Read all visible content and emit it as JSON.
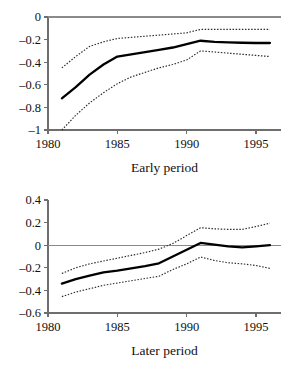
{
  "figure": {
    "background": "#ffffff",
    "line_color": "#000000",
    "band_color": "#2b2b2b",
    "axis_color": "#6e6e6e"
  },
  "chart_data": [
    {
      "id": "early",
      "type": "line",
      "title": "",
      "xlabel": "Early period",
      "ylabel": "",
      "xlim": [
        1980,
        1996.8
      ],
      "ylim": [
        -1,
        0
      ],
      "grid": false,
      "legend": "none",
      "xticks": [
        1980,
        1985,
        1990,
        1995
      ],
      "xticklabels": [
        "1980",
        "1985",
        "1990",
        "1995"
      ],
      "yticks": [
        0,
        -0.2,
        -0.4,
        -0.6,
        -0.8,
        -1
      ],
      "yticklabels": [
        "0",
        "–0.2",
        "–0.4",
        "–0.6",
        "–0.8",
        "–1"
      ],
      "x": [
        1981,
        1982,
        1983,
        1984,
        1985,
        1986,
        1987,
        1988,
        1989,
        1990,
        1991,
        1992,
        1993,
        1994,
        1995,
        1996
      ],
      "series": [
        {
          "name": "estimate",
          "style": "solid",
          "values": [
            -0.72,
            -0.62,
            -0.51,
            -0.42,
            -0.35,
            -0.33,
            -0.31,
            -0.29,
            -0.27,
            -0.24,
            -0.21,
            -0.22,
            -0.225,
            -0.228,
            -0.23,
            -0.23
          ]
        },
        {
          "name": "upper-confidence-band",
          "style": "dotted",
          "values": [
            -0.45,
            -0.35,
            -0.26,
            -0.22,
            -0.19,
            -0.18,
            -0.17,
            -0.16,
            -0.15,
            -0.14,
            -0.11,
            -0.11,
            -0.11,
            -0.11,
            -0.11,
            -0.11
          ]
        },
        {
          "name": "lower-confidence-band",
          "style": "dotted",
          "values": [
            -1.0,
            -0.87,
            -0.76,
            -0.67,
            -0.59,
            -0.53,
            -0.49,
            -0.45,
            -0.42,
            -0.38,
            -0.3,
            -0.31,
            -0.32,
            -0.33,
            -0.34,
            -0.35
          ]
        }
      ]
    },
    {
      "id": "later",
      "type": "line",
      "title": "",
      "xlabel": "Later period",
      "ylabel": "",
      "xlim": [
        1980,
        1996.8
      ],
      "ylim": [
        -0.6,
        0.4
      ],
      "grid": false,
      "legend": "none",
      "xticks": [
        1980,
        1985,
        1990,
        1995
      ],
      "xticklabels": [
        "1980",
        "1985",
        "1990",
        "1995"
      ],
      "yticks": [
        0.4,
        0.2,
        0,
        -0.2,
        -0.4,
        -0.6
      ],
      "yticklabels": [
        "0.4",
        "0.2",
        "0",
        "–0.2",
        "–0.4",
        "–0.6"
      ],
      "x": [
        1981,
        1982,
        1983,
        1984,
        1985,
        1986,
        1987,
        1988,
        1989,
        1990,
        1991,
        1992,
        1993,
        1994,
        1995,
        1996
      ],
      "series": [
        {
          "name": "estimate",
          "style": "solid",
          "values": [
            -0.34,
            -0.3,
            -0.27,
            -0.24,
            -0.225,
            -0.205,
            -0.185,
            -0.16,
            -0.1,
            -0.04,
            0.02,
            0.005,
            -0.01,
            -0.02,
            -0.01,
            0.0
          ]
        },
        {
          "name": "upper-confidence-band",
          "style": "dotted",
          "values": [
            -0.25,
            -0.2,
            -0.165,
            -0.14,
            -0.115,
            -0.09,
            -0.065,
            -0.035,
            0.015,
            0.085,
            0.155,
            0.145,
            0.14,
            0.14,
            0.165,
            0.195
          ]
        },
        {
          "name": "lower-confidence-band",
          "style": "dotted",
          "values": [
            -0.455,
            -0.415,
            -0.385,
            -0.355,
            -0.335,
            -0.315,
            -0.295,
            -0.275,
            -0.215,
            -0.165,
            -0.105,
            -0.135,
            -0.155,
            -0.165,
            -0.18,
            -0.205
          ]
        }
      ]
    }
  ]
}
